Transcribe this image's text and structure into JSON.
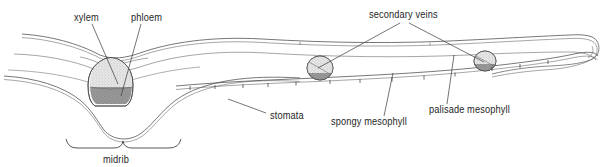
{
  "figure": {
    "background_color": "#ffffff",
    "line_color": "#4a4a4a",
    "text_color": "#262626"
  },
  "labels": {
    "xylem": "xylem",
    "phloem": "phloem",
    "secondary_veins": "secondary veins",
    "stomata": "stomata",
    "spongy_mesophyll": "spongy mesophyll",
    "palisade_mesophyll": "palisade mesophyll",
    "midrib": "midrib"
  },
  "annotations": [
    {
      "id": "xylem",
      "label": "xylem",
      "text_x": 74,
      "text_y": 20,
      "target": "midrib-vascular-bundle-upper",
      "leader": "M 92,24 L 118,84"
    },
    {
      "id": "phloem",
      "label": "phloem",
      "text_x": 130,
      "text_y": 20,
      "target": "midrib-vascular-bundle-lower",
      "leader": "M 140,24 L 121,95"
    },
    {
      "id": "secondary-veins",
      "label": "secondary veins",
      "text_x": 369,
      "text_y": 17,
      "target": "secondary-vein-bundles",
      "leader_left": "M 400,22 L 319,67",
      "leader_right": "M 408,22 L 484,62"
    },
    {
      "id": "stomata",
      "label": "stomata",
      "text_x": 270,
      "text_y": 118,
      "target": "lower-epidermis-stomata",
      "leader": "M 268,113 L 230,100"
    },
    {
      "id": "spongy-mesophyll",
      "label": "spongy mesophyll",
      "text_x": 330,
      "text_y": 124,
      "target": "spongy-mesophyll-layer",
      "leader": "M 383,116 L 392,74"
    },
    {
      "id": "palisade-mesophyll",
      "label": "palisade mesophyll",
      "text_x": 429,
      "text_y": 112,
      "target": "palisade-mesophyll-layer",
      "leader": "M 446,104 L 453,56"
    },
    {
      "id": "midrib",
      "label": "midrib",
      "text_x": 103,
      "text_y": 163,
      "target": "midrib-region",
      "brace": "M 66,140 q 3,9 11,9 l 38,0 q 8,0 10,-7 q 2,7 10,7 l 38,0 q 9,0 11,-9"
    }
  ],
  "structures": [
    {
      "id": "upper-epidermis",
      "name": "upper epidermis"
    },
    {
      "id": "palisade-mesophyll-layer",
      "name": "palisade mesophyll"
    },
    {
      "id": "spongy-mesophyll-layer",
      "name": "spongy mesophyll"
    },
    {
      "id": "lower-epidermis",
      "name": "lower epidermis"
    },
    {
      "id": "midrib-vascular-bundle",
      "name": "midrib vascular bundle"
    },
    {
      "id": "secondary-vein-left",
      "name": "secondary vein bundle (left)"
    },
    {
      "id": "secondary-vein-right",
      "name": "secondary vein bundle (right)"
    },
    {
      "id": "leaf-tip",
      "name": "leaf tip"
    }
  ],
  "stomata_positions": [
    {
      "x": 190,
      "y": 83
    },
    {
      "x": 215,
      "y": 82
    },
    {
      "x": 243,
      "y": 81
    },
    {
      "x": 268,
      "y": 80
    },
    {
      "x": 296,
      "y": 79
    },
    {
      "x": 330,
      "y": 78
    },
    {
      "x": 360,
      "y": 77
    },
    {
      "x": 392,
      "y": 75
    },
    {
      "x": 424,
      "y": 73
    },
    {
      "x": 455,
      "y": 70
    },
    {
      "x": 487,
      "y": 77
    },
    {
      "x": 514,
      "y": 73
    },
    {
      "x": 541,
      "y": 68
    }
  ]
}
